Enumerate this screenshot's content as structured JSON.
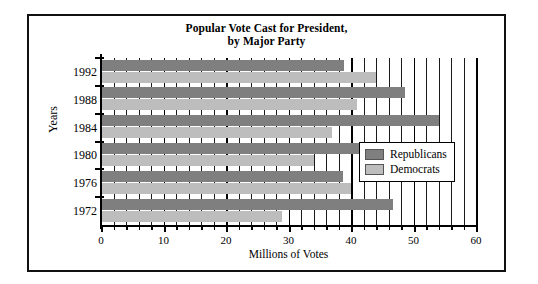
{
  "chart_data": {
    "type": "bar",
    "orientation": "horizontal",
    "title": "Popular Vote Cast for President,",
    "title_line2": "by Major Party",
    "xlabel": "Millions of Votes",
    "ylabel": "Years",
    "categories": [
      "1992",
      "1988",
      "1984",
      "1980",
      "1976",
      "1972"
    ],
    "series": [
      {
        "name": "Republicans",
        "color": "#7f7f7f",
        "values": [
          38.9,
          48.6,
          54.0,
          44.0,
          38.7,
          46.7
        ]
      },
      {
        "name": "Democrats",
        "color": "#bdbdbd",
        "values": [
          44.0,
          41.0,
          37.0,
          34.1,
          40.0,
          29.0
        ]
      }
    ],
    "xlim": [
      0,
      60
    ],
    "xticks": [
      0,
      10,
      20,
      30,
      40,
      50,
      60
    ],
    "xtick_labels": [
      "0",
      "10",
      "20",
      "30",
      "40",
      "50",
      "60"
    ],
    "minor_tick_step": 2,
    "grid": "vertical",
    "legend_position": "center-right"
  },
  "legend": {
    "items": [
      {
        "label": "Republicans"
      },
      {
        "label": "Democrats"
      }
    ]
  }
}
